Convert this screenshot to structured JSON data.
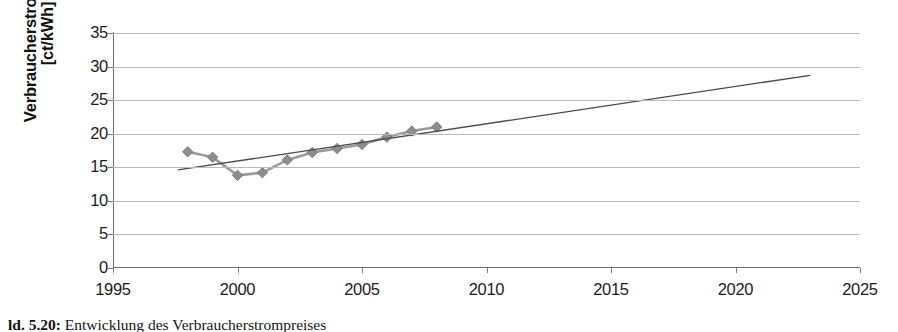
{
  "figure": {
    "caption_label": "ld. 5.20:",
    "caption_text": "Entwicklung des Verbraucherstrompreises",
    "background_color": "#ffffff"
  },
  "chart_data": {
    "type": "line",
    "title": "",
    "xlabel": "",
    "ylabel": "Verbraucherstrompreis [ct/kWh]",
    "ylabel_line1": "Verbraucherstrompreis",
    "ylabel_line2": "[ct/kWh]",
    "xlim": [
      1995,
      2025
    ],
    "ylim": [
      0,
      35
    ],
    "xticks": [
      1995,
      2000,
      2005,
      2010,
      2015,
      2020,
      2025
    ],
    "yticks": [
      0,
      5,
      10,
      15,
      20,
      25,
      30,
      35
    ],
    "grid": "horizontal",
    "legend": "none",
    "series": [
      {
        "name": "Verbraucherstrompreis",
        "marker": "diamond",
        "color": "#8d8d8d",
        "line_color": "#9a9a9a",
        "x": [
          1998,
          1999,
          2000,
          2001,
          2002,
          2003,
          2004,
          2005,
          2006,
          2007,
          2008
        ],
        "values": [
          17.3,
          16.5,
          13.8,
          14.2,
          16.1,
          17.2,
          17.8,
          18.4,
          19.5,
          20.4,
          21.0
        ]
      },
      {
        "name": "Linearer Trend",
        "type": "trendline",
        "color": "#4a4a4a",
        "x": [
          1997.6,
          2023.0
        ],
        "values": [
          14.6,
          28.7
        ]
      }
    ]
  }
}
